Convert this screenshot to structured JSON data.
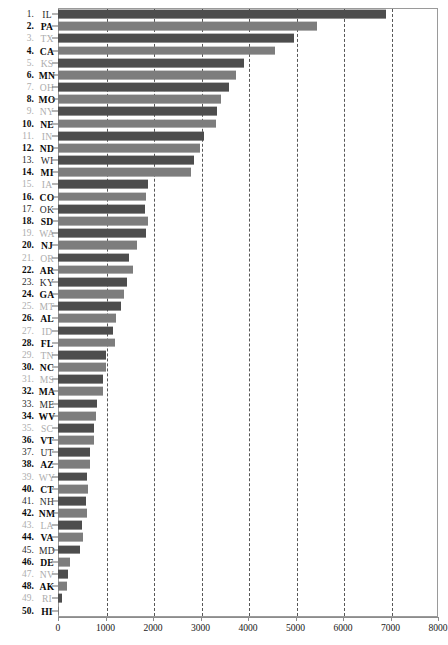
{
  "chart_data": {
    "type": "bar",
    "orientation": "horizontal",
    "title": "",
    "subtitle": "",
    "xlabel": "",
    "ylabel": "",
    "xlim": [
      0,
      8000
    ],
    "ylim": null,
    "grid": true,
    "grid_axis": "x",
    "legend": false,
    "legend_position": "none",
    "xticks": [
      0,
      1000,
      2000,
      3000,
      4000,
      5000,
      6000,
      7000,
      8000
    ],
    "xticklabels": [
      "0",
      "1000",
      "2000",
      "3000",
      "4000",
      "5000",
      "6000",
      "7000",
      "8000"
    ],
    "categories": [
      "IL",
      "PA",
      "TX",
      "CA",
      "KS",
      "MN",
      "OH",
      "MO",
      "NY",
      "NE",
      "IN",
      "ND",
      "WI",
      "MI",
      "IA",
      "CO",
      "OK",
      "SD",
      "WA",
      "NJ",
      "OR",
      "AR",
      "KY",
      "GA",
      "MT",
      "AL",
      "ID",
      "FL",
      "TN",
      "NC",
      "MS",
      "MA",
      "ME",
      "WV",
      "SC",
      "VT",
      "UT",
      "AZ",
      "WY",
      "CT",
      "NH",
      "NM",
      "LA",
      "VA",
      "MD",
      "DE",
      "NV",
      "AK",
      "RI",
      "HI"
    ],
    "values": [
      6900,
      5460,
      4960,
      4560,
      3920,
      3740,
      3600,
      3440,
      3340,
      3330,
      3070,
      2980,
      2860,
      2800,
      1900,
      1860,
      1840,
      1900,
      1860,
      1660,
      1490,
      1570,
      1450,
      1390,
      1330,
      1220,
      1160,
      1190,
      1000,
      1000,
      940,
      940,
      830,
      790,
      760,
      760,
      680,
      680,
      620,
      640,
      580,
      600,
      510,
      530,
      470,
      260,
      210,
      190,
      90,
      10
    ],
    "rows": [
      {
        "rank": "1.",
        "abbr": "IL",
        "value": 6900,
        "label_style": "norm",
        "bar_style": "dark"
      },
      {
        "rank": "2.",
        "abbr": "PA",
        "value": 5460,
        "label_style": "bold",
        "bar_style": "light"
      },
      {
        "rank": "3.",
        "abbr": "TX",
        "value": 4960,
        "label_style": "pale",
        "bar_style": "dark"
      },
      {
        "rank": "4.",
        "abbr": "CA",
        "value": 4560,
        "label_style": "bold",
        "bar_style": "light"
      },
      {
        "rank": "5.",
        "abbr": "KS",
        "value": 3920,
        "label_style": "pale",
        "bar_style": "dark"
      },
      {
        "rank": "6.",
        "abbr": "MN",
        "value": 3740,
        "label_style": "bold",
        "bar_style": "light"
      },
      {
        "rank": "7.",
        "abbr": "OH",
        "value": 3600,
        "label_style": "pale",
        "bar_style": "dark"
      },
      {
        "rank": "8.",
        "abbr": "MO",
        "value": 3440,
        "label_style": "bold",
        "bar_style": "light"
      },
      {
        "rank": "9.",
        "abbr": "NY",
        "value": 3340,
        "label_style": "pale",
        "bar_style": "dark"
      },
      {
        "rank": "10.",
        "abbr": "NE",
        "value": 3330,
        "label_style": "bold",
        "bar_style": "light"
      },
      {
        "rank": "11.",
        "abbr": "IN",
        "value": 3070,
        "label_style": "pale",
        "bar_style": "dark"
      },
      {
        "rank": "12.",
        "abbr": "ND",
        "value": 2980,
        "label_style": "bold",
        "bar_style": "light"
      },
      {
        "rank": "13.",
        "abbr": "WI",
        "value": 2860,
        "label_style": "norm",
        "bar_style": "dark"
      },
      {
        "rank": "14.",
        "abbr": "MI",
        "value": 2800,
        "label_style": "bold",
        "bar_style": "light"
      },
      {
        "rank": "15.",
        "abbr": "IA",
        "value": 1900,
        "label_style": "pale",
        "bar_style": "dark"
      },
      {
        "rank": "16.",
        "abbr": "CO",
        "value": 1860,
        "label_style": "bold",
        "bar_style": "light"
      },
      {
        "rank": "17.",
        "abbr": "OK",
        "value": 1840,
        "label_style": "norm",
        "bar_style": "dark"
      },
      {
        "rank": "18.",
        "abbr": "SD",
        "value": 1900,
        "label_style": "bold",
        "bar_style": "light"
      },
      {
        "rank": "19.",
        "abbr": "WA",
        "value": 1860,
        "label_style": "pale",
        "bar_style": "dark"
      },
      {
        "rank": "20.",
        "abbr": "NJ",
        "value": 1660,
        "label_style": "bold",
        "bar_style": "light"
      },
      {
        "rank": "21.",
        "abbr": "OR",
        "value": 1490,
        "label_style": "pale",
        "bar_style": "dark"
      },
      {
        "rank": "22.",
        "abbr": "AR",
        "value": 1570,
        "label_style": "bold",
        "bar_style": "light"
      },
      {
        "rank": "23.",
        "abbr": "KY",
        "value": 1450,
        "label_style": "norm",
        "bar_style": "dark"
      },
      {
        "rank": "24.",
        "abbr": "GA",
        "value": 1390,
        "label_style": "bold",
        "bar_style": "light"
      },
      {
        "rank": "25.",
        "abbr": "MT",
        "value": 1330,
        "label_style": "pale",
        "bar_style": "dark"
      },
      {
        "rank": "26.",
        "abbr": "AL",
        "value": 1220,
        "label_style": "bold",
        "bar_style": "light"
      },
      {
        "rank": "27.",
        "abbr": "ID",
        "value": 1160,
        "label_style": "pale",
        "bar_style": "dark"
      },
      {
        "rank": "28.",
        "abbr": "FL",
        "value": 1190,
        "label_style": "bold",
        "bar_style": "light"
      },
      {
        "rank": "29.",
        "abbr": "TN",
        "value": 1000,
        "label_style": "pale",
        "bar_style": "dark"
      },
      {
        "rank": "30.",
        "abbr": "NC",
        "value": 1000,
        "label_style": "bold",
        "bar_style": "light"
      },
      {
        "rank": "31.",
        "abbr": "MS",
        "value": 940,
        "label_style": "pale",
        "bar_style": "dark"
      },
      {
        "rank": "32.",
        "abbr": "MA",
        "value": 940,
        "label_style": "bold",
        "bar_style": "light"
      },
      {
        "rank": "33.",
        "abbr": "ME",
        "value": 830,
        "label_style": "norm",
        "bar_style": "dark"
      },
      {
        "rank": "34.",
        "abbr": "WV",
        "value": 790,
        "label_style": "bold",
        "bar_style": "light"
      },
      {
        "rank": "35.",
        "abbr": "SC",
        "value": 760,
        "label_style": "pale",
        "bar_style": "dark"
      },
      {
        "rank": "36.",
        "abbr": "VT",
        "value": 760,
        "label_style": "bold",
        "bar_style": "light"
      },
      {
        "rank": "37.",
        "abbr": "UT",
        "value": 680,
        "label_style": "norm",
        "bar_style": "dark"
      },
      {
        "rank": "38.",
        "abbr": "AZ",
        "value": 680,
        "label_style": "bold",
        "bar_style": "light"
      },
      {
        "rank": "39.",
        "abbr": "WY",
        "value": 620,
        "label_style": "pale",
        "bar_style": "dark"
      },
      {
        "rank": "40.",
        "abbr": "CT",
        "value": 640,
        "label_style": "bold",
        "bar_style": "light"
      },
      {
        "rank": "41.",
        "abbr": "NH",
        "value": 580,
        "label_style": "norm",
        "bar_style": "dark"
      },
      {
        "rank": "42.",
        "abbr": "NM",
        "value": 600,
        "label_style": "bold",
        "bar_style": "light"
      },
      {
        "rank": "43.",
        "abbr": "LA",
        "value": 510,
        "label_style": "pale",
        "bar_style": "dark"
      },
      {
        "rank": "44.",
        "abbr": "VA",
        "value": 530,
        "label_style": "bold",
        "bar_style": "light"
      },
      {
        "rank": "45.",
        "abbr": "MD",
        "value": 470,
        "label_style": "norm",
        "bar_style": "dark"
      },
      {
        "rank": "46.",
        "abbr": "DE",
        "value": 260,
        "label_style": "bold",
        "bar_style": "light"
      },
      {
        "rank": "47.",
        "abbr": "NV",
        "value": 210,
        "label_style": "pale",
        "bar_style": "dark"
      },
      {
        "rank": "48.",
        "abbr": "AK",
        "value": 190,
        "label_style": "bold",
        "bar_style": "light"
      },
      {
        "rank": "49.",
        "abbr": "RI",
        "value": 90,
        "label_style": "pale",
        "bar_style": "dark"
      },
      {
        "rank": "50.",
        "abbr": "HI",
        "value": 10,
        "label_style": "bold",
        "bar_style": "light"
      }
    ]
  }
}
